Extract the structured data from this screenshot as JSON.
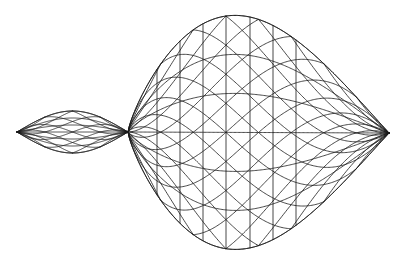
{
  "diagram": {
    "type": "wireframe-mesh",
    "stroke_color": "#1a1a1a",
    "background_color": "#ffffff",
    "stroke_width": 0.8,
    "pinch_point": {
      "x": 128,
      "y": 132
    },
    "left_lobe": {
      "tip": {
        "x": 17,
        "y": 132
      },
      "half_height": 21,
      "grid_u": 12,
      "grid_v": 8
    },
    "right_lobe": {
      "tip": {
        "x": 389,
        "y": 133
      },
      "top_y": 16,
      "bottom_y": 250,
      "peak_x": 252,
      "grid_u": 24,
      "grid_v": 16,
      "vertical_lines_x": [
        157,
        180,
        203,
        226,
        250,
        273,
        296
      ]
    }
  }
}
